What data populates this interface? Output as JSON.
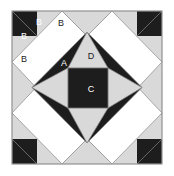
{
  "figure": {
    "width": 174,
    "height": 176,
    "background_color": "#ffffff"
  },
  "colors": {
    "dark_fabric": "#1d1d1d",
    "light_fabric": "#d9d9d9",
    "sashing": "#ffffff",
    "outline": "#8a8a8a",
    "label_on_dark": "#ffffff",
    "label_on_light": "#1a1a1a"
  },
  "block": {
    "name": "star-in-checkerboard-block",
    "bounds": {
      "x": 12,
      "y": 11,
      "width": 150,
      "height": 153
    },
    "center_square": {
      "x": 68,
      "y": 68,
      "size": 40
    }
  },
  "labels": [
    {
      "id": "label-b-1",
      "text": "B",
      "x": 39,
      "y": 23,
      "on": "dark",
      "piece": "corner-hst-dark-upper"
    },
    {
      "id": "label-b-2",
      "text": "B",
      "x": 61,
      "y": 24,
      "on": "light",
      "piece": "corner-square-light-top-right"
    },
    {
      "id": "label-b-3",
      "text": "B",
      "x": 24,
      "y": 37,
      "on": "dark",
      "piece": "corner-hst-dark-lower"
    },
    {
      "id": "label-b-4",
      "text": "B",
      "x": 24,
      "y": 60,
      "on": "light",
      "piece": "corner-square-light-bottom-left"
    },
    {
      "id": "label-a",
      "text": "A",
      "x": 64,
      "y": 64,
      "on": "dark",
      "piece": "star-point-upper-left"
    },
    {
      "id": "label-d",
      "text": "D",
      "x": 91,
      "y": 57,
      "on": "light",
      "piece": "kite-top"
    },
    {
      "id": "label-c",
      "text": "C",
      "x": 91,
      "y": 90,
      "on": "dark",
      "piece": "center-square"
    }
  ],
  "legend": {
    "piece_a": "A",
    "piece_b": "B",
    "piece_c": "C",
    "piece_d": "D"
  }
}
